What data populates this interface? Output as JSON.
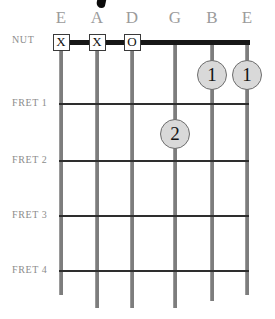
{
  "diagram": {
    "title_fragment": "",
    "nut_label": "NUT",
    "strings": [
      {
        "name": "E",
        "x": 61
      },
      {
        "name": "A",
        "x": 97
      },
      {
        "name": "D",
        "x": 132
      },
      {
        "name": "G",
        "x": 175
      },
      {
        "name": "B",
        "x": 212
      },
      {
        "name": "E",
        "x": 247
      }
    ],
    "frets": [
      {
        "label": "FRET 1",
        "y": 103
      },
      {
        "label": "FRET 2",
        "y": 160
      },
      {
        "label": "FRET 3",
        "y": 215
      },
      {
        "label": "FRET 4",
        "y": 270
      }
    ],
    "nut": {
      "y": 42,
      "x_start": 55,
      "x_end": 250
    },
    "open_mute_markers": [
      {
        "string": 0,
        "symbol": "X",
        "x": 61,
        "y": 42
      },
      {
        "string": 1,
        "symbol": "X",
        "x": 97,
        "y": 42
      },
      {
        "string": 2,
        "symbol": "O",
        "x": 132,
        "y": 42
      }
    ],
    "finger_dots": [
      {
        "finger": "1",
        "string": 4,
        "fret": 0,
        "x": 212,
        "y": 75
      },
      {
        "finger": "1",
        "string": 5,
        "fret": 0,
        "x": 247,
        "y": 75
      },
      {
        "finger": "2",
        "string": 3,
        "fret": 1,
        "x": 175,
        "y": 134
      }
    ],
    "colors": {
      "nut": "#171717",
      "fret_line": "#2e2e2e",
      "string": "#7d7d7d",
      "dot_fill": "#d9d9d9",
      "dot_border": "#6d6d6d",
      "label_text": "#8c8c8c",
      "string_letter": "#9b9b9b",
      "background": "#ffffff"
    }
  }
}
